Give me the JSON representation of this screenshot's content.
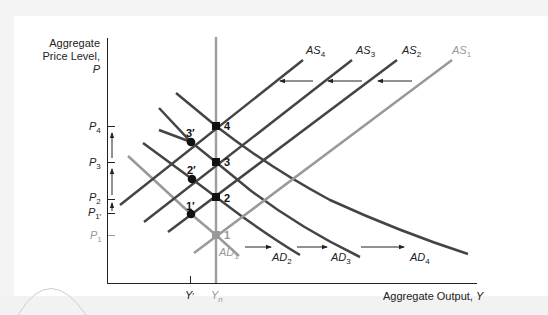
{
  "axes": {
    "y_title_line1": "Aggregate",
    "y_title_line2": "Price Level, ",
    "y_title_var": "P",
    "x_title": "Aggregate Output, ",
    "x_title_var": "Y"
  },
  "y_ticks": [
    {
      "base": "P",
      "sub": "4",
      "y": 126,
      "color": "#222"
    },
    {
      "base": "P",
      "sub": "3",
      "y": 162,
      "color": "#222"
    },
    {
      "base": "P",
      "sub": "2",
      "y": 199,
      "color": "#222"
    },
    {
      "base": "P",
      "sub": "1′",
      "y": 213,
      "color": "#222"
    },
    {
      "base": "P",
      "sub": "1",
      "y": 235,
      "color": "#999"
    }
  ],
  "x_ticks": [
    {
      "base": "Y",
      "sub": "′",
      "x": 190,
      "color": "#222"
    },
    {
      "base": "Y",
      "sub": "n",
      "x": 216,
      "color": "#999"
    }
  ],
  "curves": {
    "AS": [
      {
        "base": "AS",
        "sub": "4",
        "color": "#444"
      },
      {
        "base": "AS",
        "sub": "3",
        "color": "#444"
      },
      {
        "base": "AS",
        "sub": "2",
        "color": "#444"
      },
      {
        "base": "AS",
        "sub": "1",
        "color": "#999"
      }
    ],
    "AD": [
      {
        "base": "AD",
        "sub": "1",
        "color": "#999"
      },
      {
        "base": "AD",
        "sub": "2",
        "color": "#444"
      },
      {
        "base": "AD",
        "sub": "3",
        "color": "#444"
      },
      {
        "base": "AD",
        "sub": "4",
        "color": "#444"
      }
    ]
  },
  "points": [
    {
      "label": "1",
      "x": 216,
      "y": 235
    },
    {
      "label": "1′",
      "x": 191,
      "y": 214
    },
    {
      "label": "2",
      "x": 216,
      "y": 197
    },
    {
      "label": "2′",
      "x": 192,
      "y": 179
    },
    {
      "label": "3",
      "x": 216,
      "y": 162
    },
    {
      "label": "3′",
      "x": 191,
      "y": 142
    },
    {
      "label": "4",
      "x": 216,
      "y": 126
    }
  ],
  "colors": {
    "dark_line": "#444444",
    "light_line": "#999999",
    "axis": "#222222",
    "background": "#ffffff"
  }
}
